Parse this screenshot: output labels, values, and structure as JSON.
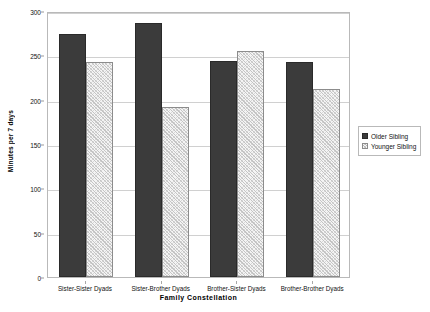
{
  "chart_data": {
    "type": "bar",
    "title": "",
    "xlabel": "Family Constellation",
    "ylabel": "Minutes per 7 days",
    "categories": [
      "Sister-Sister Dyads",
      "Sister-Brother Dyads",
      "Brother-Sister Dyads",
      "Brother-Brother Dyads"
    ],
    "series": [
      {
        "name": "Older Sibling",
        "values": [
          274,
          286,
          244,
          242
        ],
        "color": "#3b3b3b",
        "fill": "solid"
      },
      {
        "name": "Younger Sibling",
        "values": [
          243,
          192,
          255,
          212
        ],
        "color": "#c4c4c4",
        "fill": "hatched"
      }
    ],
    "ylim": [
      0,
      300
    ],
    "yticks": [
      0,
      50,
      100,
      150,
      200,
      250,
      300
    ],
    "ytick_labels": [
      "0",
      "50",
      "100",
      "150",
      "200",
      "250",
      "300"
    ],
    "grid": true,
    "legend_position": "right",
    "legend_entries": [
      "Older Sibling",
      "Younger Sibling"
    ]
  },
  "axes": {
    "y_title": "Minutes per 7 days",
    "x_title": "Family Constellation"
  },
  "legend": {
    "older_label": "Older Sibling",
    "younger_label": "Younger Sibling"
  }
}
